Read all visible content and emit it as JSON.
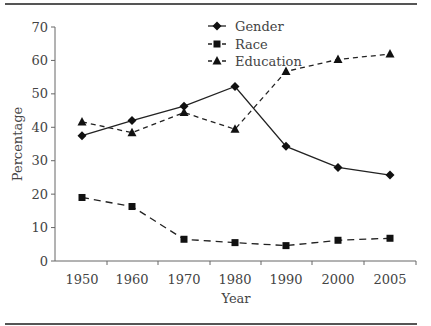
{
  "chart_data": {
    "type": "line",
    "title": "",
    "xlabel": "Year",
    "ylabel": "Percentage",
    "x": [
      1950,
      1960,
      1970,
      1980,
      1990,
      2000,
      2005
    ],
    "x_tick_labels": [
      "1950",
      "1960",
      "1970",
      "1980",
      "1990",
      "2000",
      "2005"
    ],
    "y_ticks": [
      0,
      10,
      20,
      30,
      40,
      50,
      60,
      70
    ],
    "y_tick_labels": [
      "0",
      "10",
      "20",
      "30",
      "40",
      "50",
      "60",
      "70"
    ],
    "ylim": [
      0,
      70
    ],
    "grid": false,
    "legend_position": "top-center",
    "series": [
      {
        "name": "Gender",
        "marker": "diamond",
        "line": "solid",
        "values": [
          37.5,
          42,
          46.3,
          52.2,
          34.3,
          28,
          25.7
        ]
      },
      {
        "name": "Race",
        "marker": "square",
        "line": "dashed",
        "values": [
          19,
          16.3,
          6.5,
          5.5,
          4.6,
          6.2,
          6.8
        ]
      },
      {
        "name": "Education",
        "marker": "triangle",
        "line": "dashed",
        "values": [
          41.6,
          38.4,
          44.4,
          39.4,
          56.7,
          60.3,
          61.9
        ]
      }
    ]
  }
}
